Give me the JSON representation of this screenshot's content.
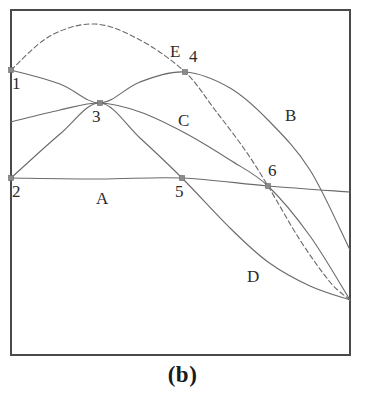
{
  "figure": {
    "caption": "(b)",
    "frame": {
      "x": 11,
      "y": 10,
      "width": 339,
      "height": 345,
      "stroke": "#4a4a4a",
      "stroke_width": 2
    },
    "background": "#ffffff",
    "curve_color": "#6a6a6a",
    "marker_color": "#8a8a8a",
    "text_color": "#2b2b2b"
  },
  "chart_data": {
    "type": "line",
    "title": "(b)",
    "xlabel": "",
    "ylabel": "",
    "grid": false,
    "legend": "inline-labels",
    "axis_note": "unlabeled axes; framed box plot, no tick marks",
    "xlim": [
      11,
      350
    ],
    "ylim": [
      10,
      355
    ],
    "series": [
      {
        "name": "A",
        "label": "A",
        "style": "solid",
        "label_x": 96,
        "label_y": 190,
        "description": "nearly horizontal gently descending line",
        "points": [
          [
            11,
            178
          ],
          [
            100,
            179
          ],
          [
            182,
            178
          ],
          [
            268,
            186
          ],
          [
            350,
            192
          ]
        ]
      },
      {
        "name": "B",
        "label": "B",
        "style": "solid",
        "label_x": 285,
        "label_y": 107,
        "description": "broad arch rising from left edge, peaking near point 4, descending to lower right",
        "points": [
          [
            11,
            70
          ],
          [
            60,
            84
          ],
          [
            100,
            103
          ],
          [
            140,
            82
          ],
          [
            185,
            72
          ],
          [
            230,
            88
          ],
          [
            268,
            120
          ],
          [
            310,
            170
          ],
          [
            350,
            250
          ]
        ]
      },
      {
        "name": "C",
        "label": "C",
        "style": "solid",
        "label_x": 178,
        "label_y": 112,
        "description": "low arch rising from left edge through point 3, descending through point 6 to lower right",
        "points": [
          [
            11,
            122
          ],
          [
            60,
            110
          ],
          [
            100,
            103
          ],
          [
            140,
            112
          ],
          [
            185,
            133
          ],
          [
            230,
            160
          ],
          [
            268,
            186
          ],
          [
            310,
            236
          ],
          [
            350,
            300
          ]
        ]
      },
      {
        "name": "D",
        "label": "D",
        "style": "solid",
        "label_x": 247,
        "label_y": 268,
        "description": "rising steeply from point 2 through point 3, then falling steeply through point 5 toward lower right",
        "points": [
          [
            11,
            178
          ],
          [
            60,
            134
          ],
          [
            100,
            103
          ],
          [
            140,
            138
          ],
          [
            182,
            178
          ],
          [
            230,
            228
          ],
          [
            268,
            262
          ],
          [
            310,
            286
          ],
          [
            350,
            300
          ]
        ]
      },
      {
        "name": "E",
        "label": "E",
        "style": "dashed",
        "label_x": 170,
        "label_y": 43,
        "description": "tall dashed arch from point 1, peaking near x=95, descending through points 4 and 6 to lower right",
        "points": [
          [
            11,
            70
          ],
          [
            50,
            36
          ],
          [
            95,
            24
          ],
          [
            140,
            40
          ],
          [
            185,
            72
          ],
          [
            215,
            110
          ],
          [
            245,
            150
          ],
          [
            268,
            186
          ],
          [
            300,
            240
          ],
          [
            330,
            282
          ],
          [
            350,
            300
          ]
        ]
      }
    ],
    "points": [
      {
        "id": "1",
        "label": "1",
        "x": 11,
        "y": 70,
        "label_x": 12,
        "label_y": 75,
        "note": "left edge start of curves B and E"
      },
      {
        "id": "2",
        "label": "2",
        "x": 11,
        "y": 178,
        "label_x": 12,
        "label_y": 183,
        "note": "left edge start of line A and curve D"
      },
      {
        "id": "3",
        "label": "3",
        "x": 100,
        "y": 103,
        "label_x": 92,
        "label_y": 108,
        "note": "crossing of curves B, C and D"
      },
      {
        "id": "4",
        "label": "4",
        "x": 185,
        "y": 72,
        "label_x": 189,
        "label_y": 48,
        "note": "crossing of curve B and dashed curve E"
      },
      {
        "id": "5",
        "label": "5",
        "x": 182,
        "y": 178,
        "label_x": 175,
        "label_y": 183,
        "note": "crossing of line A and curve D"
      },
      {
        "id": "6",
        "label": "6",
        "x": 268,
        "y": 186,
        "label_x": 268,
        "label_y": 162,
        "note": "crossing of line A, curve C and dashed curve E"
      }
    ]
  }
}
